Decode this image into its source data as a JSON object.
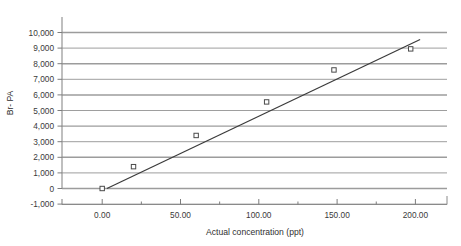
{
  "chart_data": {
    "type": "scatter",
    "title": "",
    "xlabel": "Actual concentration (ppt)",
    "ylabel": "Br- PA",
    "xlim": [
      -25,
      220
    ],
    "ylim": [
      -1000,
      10000
    ],
    "grid": true,
    "legend": false,
    "x_ticks": [
      "0.00",
      "50.00",
      "100.00",
      "150.00",
      "200.00"
    ],
    "x_tick_values": [
      0,
      50,
      100,
      150,
      200
    ],
    "y_ticks": [
      "-1,000",
      "0",
      "1,000",
      "2,000",
      "3,000",
      "4,000",
      "5,000",
      "6,000",
      "7,000",
      "8,000",
      "9,000",
      "10,000"
    ],
    "y_tick_values": [
      -1000,
      0,
      1000,
      2000,
      3000,
      4000,
      5000,
      6000,
      7000,
      8000,
      9000,
      10000
    ],
    "series": [
      {
        "name": "Br- PA measurements",
        "marker": "open-square",
        "x": [
          0,
          20,
          60,
          105,
          148,
          197
        ],
        "y": [
          0,
          1400,
          3400,
          5550,
          7600,
          8950
        ],
        "points": [
          {
            "x": 0,
            "y": 0
          },
          {
            "x": 20,
            "y": 1400
          },
          {
            "x": 60,
            "y": 3400
          },
          {
            "x": 105,
            "y": 5550
          },
          {
            "x": 148,
            "y": 7600
          },
          {
            "x": 197,
            "y": 8950
          }
        ]
      },
      {
        "name": "Linear trendline",
        "type": "line",
        "x": [
          3,
          203
        ],
        "y": [
          0,
          9550
        ]
      }
    ],
    "colors": {
      "marker_stroke": "#4a4a4a",
      "trendline": "#3b3b3b",
      "gridline": "#9a9a9a",
      "axis": "#6f6f6f",
      "text": "#2f2f2f"
    }
  },
  "axes": {
    "y_title": "Br- PA",
    "x_title": "Actual concentration (ppt)"
  }
}
